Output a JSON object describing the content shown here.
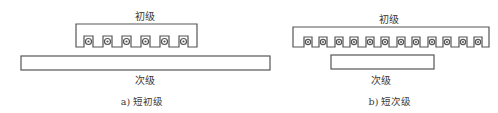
{
  "diagram": {
    "panels": [
      {
        "id": "a",
        "primary_label": "初级",
        "secondary_label": "次级",
        "caption": "a) 短初级",
        "slot_count": 6
      },
      {
        "id": "b",
        "primary_label": "初级",
        "secondary_label": "次级",
        "caption": "b) 短次级",
        "slot_count": 12
      }
    ],
    "colors": {
      "stroke": "#555555",
      "background": "#ffffff"
    }
  }
}
